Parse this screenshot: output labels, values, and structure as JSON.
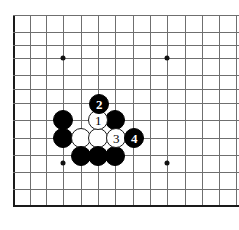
{
  "diagram": {
    "kind": "go-board-diagram",
    "caption_remnant": "",
    "board": {
      "style": "corner-crop",
      "line_color": "#6f6f6f",
      "edge_color": "#1a1a1a",
      "background_color": "#ffffff",
      "grid_spacing_px": 17.3,
      "origin_x_px": 13,
      "origin_y_px": 15,
      "columns": 13,
      "rows": 12,
      "left_edge_x_px": 13,
      "bottom_edge_y_px": 205,
      "top_line_y_px": 15,
      "right_extent_px": 239,
      "vertical_lines_x": [
        13,
        30,
        46,
        63,
        81,
        98,
        115,
        133,
        150,
        167,
        185,
        202,
        219,
        236
      ],
      "horizontal_lines_y": [
        15,
        32,
        45,
        58,
        75,
        89,
        103,
        120,
        138,
        155,
        172,
        189,
        205
      ]
    },
    "star_points": [
      {
        "name": "star-point-upper-left",
        "x": 63,
        "y": 58
      },
      {
        "name": "star-point-upper-right",
        "x": 167,
        "y": 58
      },
      {
        "name": "star-point-lower-left",
        "x": 63,
        "y": 163
      },
      {
        "name": "star-point-lower-right",
        "x": 167,
        "y": 163
      }
    ],
    "stones": [
      {
        "id": "black-stone-a",
        "color": "black",
        "x": 63,
        "y": 120,
        "radius": 10,
        "label": ""
      },
      {
        "id": "black-stone-b",
        "color": "black",
        "x": 115,
        "y": 120,
        "radius": 10,
        "label": ""
      },
      {
        "id": "black-stone-c",
        "color": "black",
        "x": 63,
        "y": 138,
        "radius": 10,
        "label": ""
      },
      {
        "id": "white-stone-d",
        "color": "white",
        "x": 81,
        "y": 138,
        "radius": 10,
        "label": ""
      },
      {
        "id": "white-stone-e",
        "color": "white",
        "x": 98,
        "y": 138,
        "radius": 10,
        "label": ""
      },
      {
        "id": "black-stone-f",
        "color": "black",
        "x": 81,
        "y": 156,
        "radius": 10,
        "label": ""
      },
      {
        "id": "black-stone-g",
        "color": "black",
        "x": 98,
        "y": 156,
        "radius": 10,
        "label": ""
      },
      {
        "id": "black-stone-h",
        "color": "black",
        "x": 115,
        "y": 156,
        "radius": 10,
        "label": ""
      }
    ],
    "numbered_moves": [
      {
        "id": "move-1",
        "color": "white",
        "x": 98,
        "y": 120,
        "radius": 10,
        "label": "1",
        "player": "White"
      },
      {
        "id": "move-2",
        "color": "black",
        "x": 99,
        "y": 104,
        "radius": 10,
        "label": "2",
        "player": "Black"
      },
      {
        "id": "move-3",
        "color": "white",
        "x": 116,
        "y": 138,
        "radius": 10,
        "label": "3",
        "player": "White"
      },
      {
        "id": "move-4",
        "color": "black",
        "x": 134,
        "y": 138,
        "radius": 10,
        "label": "4",
        "player": "Black"
      }
    ]
  }
}
